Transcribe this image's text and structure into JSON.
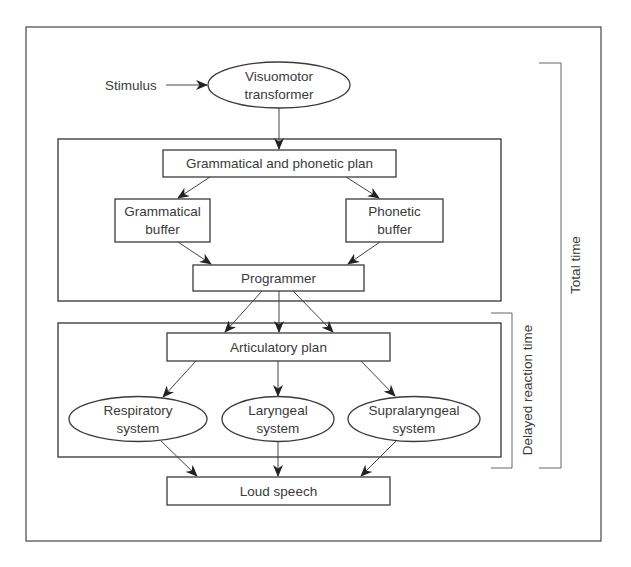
{
  "diagram": {
    "stimulus": "Stimulus",
    "visuomotor": [
      "Visuomotor",
      "transformer"
    ],
    "planning_stage": {
      "plan": "Grammatical and phonetic plan",
      "grammatical_buffer": [
        "Grammatical",
        "buffer"
      ],
      "phonetic_buffer": [
        "Phonetic",
        "buffer"
      ],
      "programmer": "Programmer"
    },
    "execution_stage": {
      "articulatory_plan": "Articulatory plan",
      "respiratory": [
        "Respiratory",
        "system"
      ],
      "laryngeal": [
        "Laryngeal",
        "system"
      ],
      "supralaryngeal": [
        "Supralaryngeal",
        "system"
      ]
    },
    "output": "Loud speech",
    "brackets": {
      "delayed_reaction_time": "Delayed reaction time",
      "total_time": "Total time"
    }
  },
  "colors": {
    "stroke": "#3a3a3a",
    "text": "#3a3a3a",
    "background": "#ffffff"
  }
}
